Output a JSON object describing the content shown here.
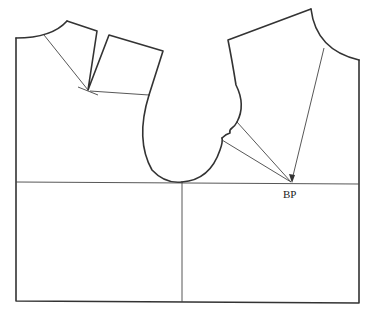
{
  "diagram": {
    "type": "bodice-pattern-draft",
    "labels": {
      "bust_point": "BP"
    },
    "colors": {
      "line": "#333333",
      "background": "#ffffff"
    }
  }
}
